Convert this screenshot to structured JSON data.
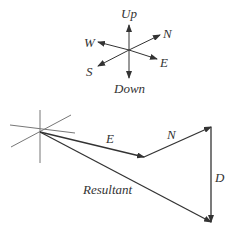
{
  "compass": {
    "labels": {
      "up": "Up",
      "down": "Down",
      "north": "N",
      "south": "S",
      "east": "E",
      "west": "W"
    }
  },
  "vectors": {
    "east_label": "E",
    "north_label": "N",
    "down_label": "D",
    "resultant_label": "Resultant"
  },
  "colors": {
    "line": "#333333",
    "axis": "#777777"
  }
}
